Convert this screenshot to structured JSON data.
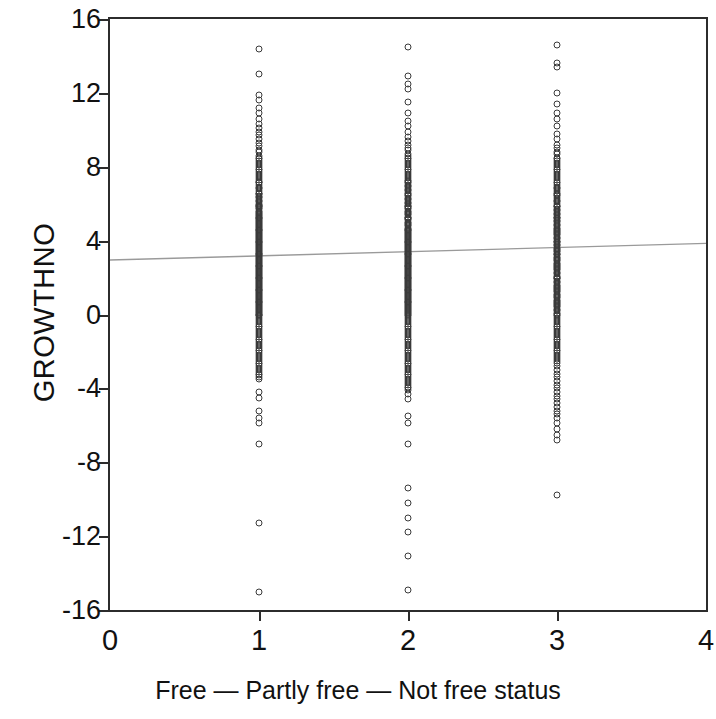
{
  "chart_data": {
    "type": "scatter",
    "title": "",
    "xlabel": "Free — Partly free — Not free status",
    "ylabel": "GROWTHNO",
    "xlim": [
      0,
      4
    ],
    "ylim": [
      -16,
      16
    ],
    "xticks": [
      0,
      1,
      2,
      3,
      4
    ],
    "yticks": [
      16,
      12,
      8,
      4,
      0,
      -4,
      -8,
      -12,
      -16
    ],
    "xtick_labels": [
      "0",
      "1",
      "2",
      "3",
      "4"
    ],
    "ytick_labels": [
      "16",
      "12",
      "8",
      "4",
      "0",
      "-4",
      "-8",
      "-12",
      "-16"
    ],
    "grid": false,
    "legend": null,
    "marker": "open-circle",
    "marker_color": "#3a3a3a",
    "fit_line_color": "#9a9a9a",
    "fit_line": {
      "x": [
        0,
        4
      ],
      "y": [
        2.95,
        3.85
      ],
      "slope": 0.225,
      "intercept": 2.95
    },
    "series": [
      {
        "name": "Free",
        "x": 1,
        "y": [
          14.4,
          13.0,
          11.9,
          11.6,
          11.2,
          10.9,
          10.6,
          10.3,
          10.1,
          9.9,
          9.7,
          9.5,
          9.3,
          9.1,
          8.9,
          8.8,
          8.6,
          8.5,
          8.4,
          8.3,
          8.2,
          8.1,
          8.0,
          7.9,
          7.8,
          7.7,
          7.6,
          7.5,
          7.4,
          7.3,
          7.2,
          7.15,
          7.1,
          7.0,
          6.9,
          6.85,
          6.8,
          6.7,
          6.6,
          6.55,
          6.5,
          6.4,
          6.35,
          6.3,
          6.2,
          6.15,
          6.1,
          6.0,
          5.95,
          5.9,
          5.85,
          5.8,
          5.75,
          5.7,
          5.6,
          5.55,
          5.5,
          5.45,
          5.4,
          5.35,
          5.3,
          5.25,
          5.2,
          5.15,
          5.1,
          5.05,
          5.0,
          4.95,
          4.9,
          4.85,
          4.8,
          4.75,
          4.7,
          4.65,
          4.6,
          4.55,
          4.5,
          4.45,
          4.4,
          4.35,
          4.3,
          4.25,
          4.2,
          4.15,
          4.1,
          4.05,
          4.0,
          3.95,
          3.9,
          3.85,
          3.8,
          3.75,
          3.7,
          3.65,
          3.6,
          3.55,
          3.5,
          3.45,
          3.4,
          3.35,
          3.3,
          3.25,
          3.2,
          3.15,
          3.1,
          3.05,
          3.0,
          2.95,
          2.9,
          2.85,
          2.8,
          2.75,
          2.7,
          2.65,
          2.6,
          2.55,
          2.5,
          2.45,
          2.4,
          2.35,
          2.3,
          2.25,
          2.2,
          2.15,
          2.1,
          2.05,
          2.0,
          1.95,
          1.9,
          1.85,
          1.8,
          1.75,
          1.7,
          1.65,
          1.6,
          1.55,
          1.5,
          1.45,
          1.4,
          1.35,
          1.3,
          1.25,
          1.2,
          1.15,
          1.1,
          1.05,
          1.0,
          0.95,
          0.9,
          0.85,
          0.8,
          0.75,
          0.7,
          0.65,
          0.6,
          0.55,
          0.5,
          0.45,
          0.4,
          0.35,
          0.3,
          0.25,
          0.2,
          0.15,
          0.1,
          0.05,
          0.0,
          -0.05,
          -0.1,
          -0.2,
          -0.3,
          -0.4,
          -0.5,
          -0.6,
          -0.7,
          -0.8,
          -0.9,
          -1.0,
          -1.1,
          -1.2,
          -1.3,
          -1.4,
          -1.5,
          -1.6,
          -1.7,
          -1.8,
          -1.9,
          -2.0,
          -2.1,
          -2.2,
          -2.3,
          -2.4,
          -2.5,
          -2.6,
          -2.7,
          -2.8,
          -2.9,
          -3.0,
          -3.1,
          -3.2,
          -3.3,
          -3.4,
          -3.5,
          -4.2,
          -4.5,
          -5.2,
          -5.6,
          -5.9,
          -7.0,
          -11.3,
          -15.0
        ]
      },
      {
        "name": "Partly free",
        "x": 2,
        "y": [
          14.5,
          12.9,
          12.5,
          12.2,
          11.5,
          10.9,
          10.5,
          10.2,
          9.9,
          9.6,
          9.4,
          9.2,
          9.0,
          8.9,
          8.7,
          8.6,
          8.5,
          8.4,
          8.3,
          8.2,
          8.1,
          8.0,
          7.9,
          7.8,
          7.7,
          7.6,
          7.5,
          7.4,
          7.3,
          7.25,
          7.2,
          7.1,
          7.0,
          6.95,
          6.9,
          6.8,
          6.75,
          6.7,
          6.6,
          6.5,
          6.45,
          6.4,
          6.3,
          6.25,
          6.2,
          6.1,
          6.05,
          6.0,
          5.9,
          5.85,
          5.8,
          5.75,
          5.7,
          5.6,
          5.55,
          5.5,
          5.45,
          5.4,
          5.3,
          5.25,
          5.2,
          5.15,
          5.1,
          5.0,
          4.95,
          4.9,
          4.85,
          4.8,
          4.7,
          4.65,
          4.6,
          4.55,
          4.5,
          4.45,
          4.4,
          4.35,
          4.3,
          4.25,
          4.2,
          4.15,
          4.1,
          4.05,
          4.0,
          3.95,
          3.9,
          3.85,
          3.8,
          3.75,
          3.7,
          3.65,
          3.6,
          3.55,
          3.5,
          3.45,
          3.4,
          3.35,
          3.3,
          3.25,
          3.2,
          3.15,
          3.1,
          3.05,
          3.0,
          2.95,
          2.9,
          2.85,
          2.8,
          2.75,
          2.7,
          2.65,
          2.6,
          2.55,
          2.5,
          2.45,
          2.4,
          2.35,
          2.3,
          2.25,
          2.2,
          2.15,
          2.1,
          2.05,
          2.0,
          1.95,
          1.9,
          1.85,
          1.8,
          1.75,
          1.7,
          1.65,
          1.6,
          1.55,
          1.5,
          1.45,
          1.4,
          1.35,
          1.3,
          1.25,
          1.2,
          1.15,
          1.1,
          1.05,
          1.0,
          0.95,
          0.9,
          0.85,
          0.8,
          0.75,
          0.7,
          0.65,
          0.6,
          0.55,
          0.5,
          0.45,
          0.4,
          0.35,
          0.3,
          0.25,
          0.2,
          0.15,
          0.1,
          0.05,
          0.0,
          -0.1,
          -0.2,
          -0.3,
          -0.4,
          -0.5,
          -0.6,
          -0.7,
          -0.8,
          -0.9,
          -1.0,
          -1.1,
          -1.2,
          -1.3,
          -1.4,
          -1.5,
          -1.6,
          -1.7,
          -1.8,
          -1.9,
          -2.0,
          -2.1,
          -2.2,
          -2.3,
          -2.4,
          -2.5,
          -2.6,
          -2.7,
          -2.8,
          -2.9,
          -3.0,
          -3.1,
          -3.2,
          -3.3,
          -3.4,
          -3.5,
          -3.6,
          -3.7,
          -3.8,
          -3.9,
          -4.0,
          -4.1,
          -4.3,
          -4.6,
          -5.5,
          -5.9,
          -7.0,
          -9.4,
          -10.2,
          -11.0,
          -11.8,
          -13.1,
          -14.9
        ]
      },
      {
        "name": "Not free",
        "x": 3,
        "y": [
          14.6,
          13.6,
          13.4,
          12.0,
          11.4,
          10.9,
          10.6,
          10.2,
          9.8,
          9.5,
          9.2,
          9.0,
          8.8,
          8.7,
          8.5,
          8.4,
          8.3,
          8.2,
          8.1,
          8.0,
          7.9,
          7.8,
          7.7,
          7.6,
          7.5,
          7.4,
          7.3,
          7.2,
          7.1,
          7.0,
          6.9,
          6.85,
          6.8,
          6.7,
          6.6,
          6.5,
          6.45,
          6.4,
          6.3,
          6.2,
          6.15,
          6.1,
          6.0,
          5.9,
          5.85,
          5.8,
          5.7,
          5.65,
          5.6,
          5.5,
          5.45,
          5.4,
          5.3,
          5.25,
          5.2,
          5.1,
          5.05,
          5.0,
          4.9,
          4.85,
          4.8,
          4.7,
          4.65,
          4.6,
          4.5,
          4.45,
          4.4,
          4.35,
          4.3,
          4.2,
          4.15,
          4.1,
          4.0,
          3.95,
          3.9,
          3.8,
          3.75,
          3.7,
          3.6,
          3.55,
          3.5,
          3.45,
          3.4,
          3.3,
          3.25,
          3.2,
          3.1,
          3.05,
          3.0,
          2.95,
          2.9,
          2.8,
          2.75,
          2.7,
          2.6,
          2.55,
          2.5,
          2.45,
          2.4,
          2.3,
          2.25,
          2.2,
          2.1,
          2.05,
          2.0,
          1.95,
          1.9,
          1.8,
          1.75,
          1.7,
          1.6,
          1.55,
          1.5,
          1.45,
          1.4,
          1.3,
          1.25,
          1.2,
          1.1,
          1.05,
          1.0,
          0.95,
          0.9,
          0.8,
          0.75,
          0.7,
          0.6,
          0.55,
          0.5,
          0.45,
          0.4,
          0.3,
          0.25,
          0.2,
          0.1,
          0.05,
          0.0,
          -0.1,
          -0.2,
          -0.3,
          -0.4,
          -0.5,
          -0.6,
          -0.7,
          -0.8,
          -0.9,
          -1.0,
          -1.1,
          -1.2,
          -1.3,
          -1.4,
          -1.5,
          -1.6,
          -1.7,
          -1.8,
          -1.9,
          -2.0,
          -2.1,
          -2.2,
          -2.3,
          -2.4,
          -2.5,
          -2.6,
          -2.8,
          -3.0,
          -3.2,
          -3.4,
          -3.6,
          -3.8,
          -4.0,
          -4.2,
          -4.4,
          -4.6,
          -4.8,
          -5.0,
          -5.2,
          -5.4,
          -5.6,
          -5.9,
          -6.2,
          -6.5,
          -6.8,
          -9.8
        ]
      }
    ]
  }
}
